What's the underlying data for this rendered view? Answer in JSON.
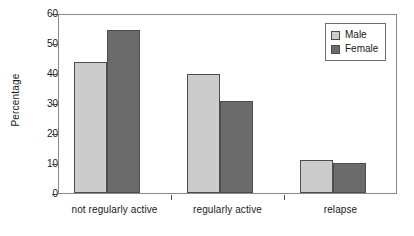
{
  "chart_data": {
    "type": "bar",
    "title": "",
    "subtitle": "",
    "xlabel": "",
    "ylabel": "Percentage",
    "categories": [
      "not regularly active",
      "regularly active",
      "relapse"
    ],
    "series": [
      {
        "name": "Male",
        "color": "#cccccc",
        "values": [
          44,
          40,
          11
        ]
      },
      {
        "name": "Female",
        "color": "#6b6b6b",
        "values": [
          55,
          31,
          10
        ]
      }
    ],
    "ylim": [
      0,
      60
    ],
    "ytick_labels": [
      "0",
      "10",
      "20",
      "30",
      "40",
      "50",
      "60"
    ],
    "ytick_values": [
      0,
      10,
      20,
      30,
      40,
      50,
      60
    ],
    "grid": false,
    "legend_position": "top-right",
    "legend_entries": [
      "Male",
      "Female"
    ],
    "annotations": []
  },
  "axis": {
    "y_title": "Percentage",
    "y_labels": {
      "t0": "0",
      "t10": "10",
      "t20": "20",
      "t30": "30",
      "t40": "40",
      "t50": "50",
      "t60": "60"
    },
    "x_labels": {
      "c0": "not regularly active",
      "c1": "regularly active",
      "c2": "relapse"
    }
  },
  "legend": {
    "male_label": "Male",
    "female_label": "Female"
  },
  "colors": {
    "male": "#cccccc",
    "female": "#6b6b6b",
    "bar_outline": "#4d4d4d",
    "frame": "#8a8a8a",
    "text": "#1a1a1a",
    "background": "#ffffff"
  }
}
